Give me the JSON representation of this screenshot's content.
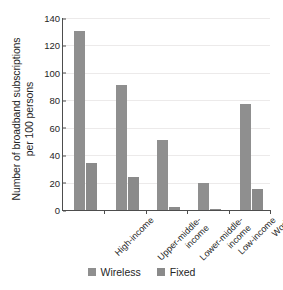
{
  "chart_data": {
    "type": "bar",
    "title": "",
    "xlabel": "",
    "ylabel": "Number of broadband subscriptions per 100 persons",
    "ylabel_line1": "Number of broadband subscriptions",
    "ylabel_line2": "per 100 persons",
    "ylim": [
      0,
      140
    ],
    "ytick_values": [
      0,
      20,
      40,
      60,
      80,
      100,
      120,
      140
    ],
    "ytick_labels": [
      "0",
      "20",
      "40",
      "60",
      "80",
      "100",
      "120",
      "140"
    ],
    "grid": true,
    "legend_position": "bottom",
    "categories": [
      "High-income",
      "Upper-middle-income",
      "Lower-middle-income",
      "Low-income",
      "World"
    ],
    "category_label_lines": [
      [
        "High-income"
      ],
      [
        "Upper-middle-",
        "income"
      ],
      [
        "Lower-middle-",
        "income"
      ],
      [
        "Low-income"
      ],
      [
        "World"
      ]
    ],
    "series": [
      {
        "name": "Wireless",
        "color": "#8f8f8f",
        "values": [
          130.5,
          91.0,
          51.0,
          19.5,
          77.0
        ]
      },
      {
        "name": "Fixed",
        "color": "#8a8a8a",
        "values": [
          34.5,
          24.0,
          2.5,
          0.6,
          15.0
        ]
      }
    ]
  },
  "legend": {
    "items": [
      {
        "label": "Wireless",
        "color": "#8f8f8f"
      },
      {
        "label": "Fixed",
        "color": "#8a8a8a"
      }
    ]
  }
}
